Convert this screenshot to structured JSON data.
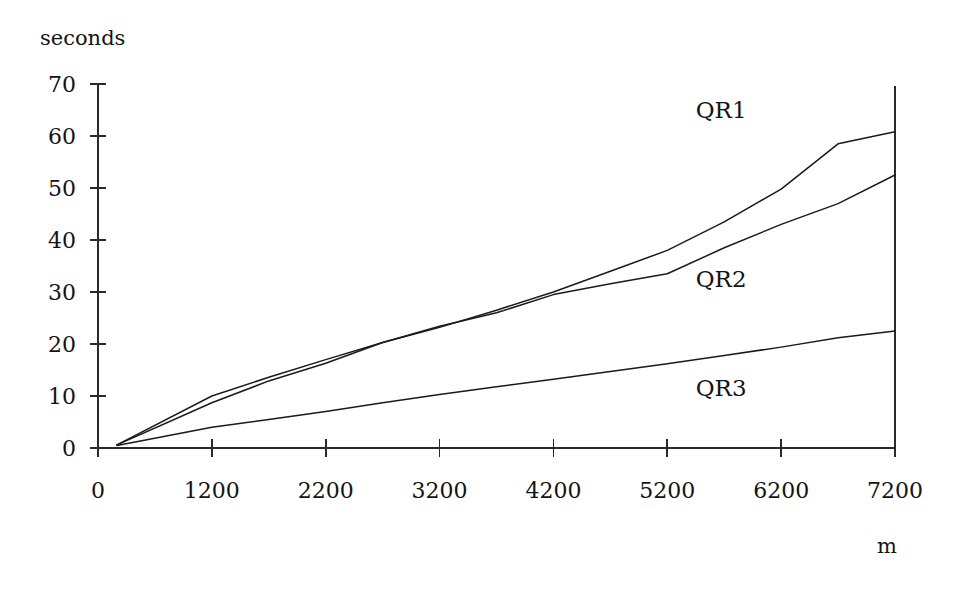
{
  "chart_data": {
    "type": "line",
    "title": "",
    "subtitle": "",
    "xlabel": "m",
    "ylabel": "seconds",
    "grid": false,
    "legend_position": "inline-right",
    "xlim": [
      0,
      7200
    ],
    "ylim": [
      0,
      70
    ],
    "x_ticks": [
      0,
      1200,
      2200,
      3200,
      4200,
      5200,
      6200,
      7200
    ],
    "x_tick_labels": [
      "0",
      "1200",
      "2200",
      "3200",
      "4200",
      "5200",
      "6200",
      "7200"
    ],
    "y_ticks": [
      0,
      10,
      20,
      30,
      40,
      50,
      60,
      70
    ],
    "y_tick_labels": [
      "0",
      "10",
      "20",
      "30",
      "40",
      "50",
      "60",
      "70"
    ],
    "x": [
      200,
      1200,
      1700,
      2200,
      2700,
      3200,
      3700,
      4200,
      4700,
      5200,
      5700,
      6200,
      6700,
      7200
    ],
    "series": [
      {
        "name": "QR1",
        "label": "QR1",
        "values": [
          0.6,
          10.0,
          13.6,
          17.0,
          20.3,
          23.2,
          26.5,
          30.0,
          34.0,
          38.0,
          43.5,
          49.8,
          58.5,
          60.8
        ],
        "label_x": 5450,
        "label_y": 63.5
      },
      {
        "name": "QR2",
        "label": "QR2",
        "values": [
          0.6,
          8.7,
          12.9,
          16.3,
          20.3,
          23.4,
          26.0,
          29.5,
          31.6,
          33.5,
          38.5,
          43.0,
          47.0,
          52.5
        ],
        "label_x": 5450,
        "label_y": 31.0
      },
      {
        "name": "QR3",
        "label": "QR3",
        "values": [
          0.5,
          4.0,
          5.5,
          7.0,
          8.7,
          10.3,
          11.8,
          13.2,
          14.7,
          16.2,
          17.8,
          19.4,
          21.2,
          22.5
        ],
        "label_x": 5450,
        "label_y": 10.0
      }
    ],
    "qr2_peak": {
      "x": 6200,
      "y": 49.5
    },
    "qr2_dip": {
      "x": 6700,
      "y": 47.4
    },
    "qr1_bend": {
      "x": 6700,
      "y": 58.5
    }
  },
  "axis": {
    "y_title": "seconds",
    "x_title": "m"
  },
  "geometry": {
    "plot_left": 98,
    "plot_right": 895,
    "plot_top": 84,
    "plot_bottom": 448
  }
}
